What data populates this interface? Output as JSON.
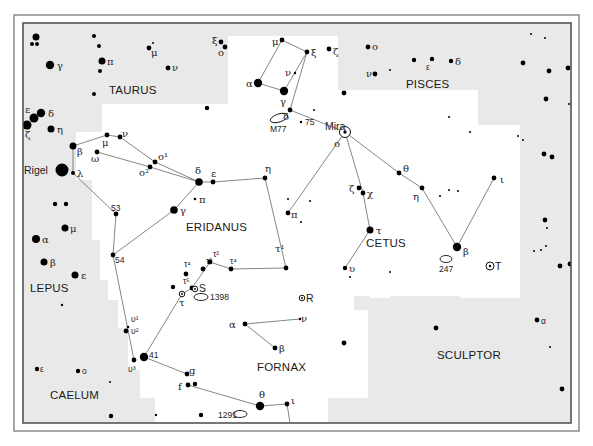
{
  "colors": {
    "outside": "#e9e9e9",
    "inside": "#ffffff",
    "frame_outer": "#8a8a8a",
    "frame_inner": "#4a4a4a",
    "line": "#777777",
    "star": "#000000"
  },
  "frame": {
    "outer": {
      "x": 14,
      "y": 15,
      "w": 565,
      "h": 416
    },
    "inner": {
      "x": 23,
      "y": 23,
      "w": 548,
      "h": 400
    }
  },
  "highlight_region": [
    [
      228,
      36
    ],
    [
      338,
      36
    ],
    [
      338,
      90
    ],
    [
      478,
      90
    ],
    [
      478,
      125
    ],
    [
      520,
      125
    ],
    [
      520,
      298
    ],
    [
      460,
      298
    ],
    [
      460,
      296
    ],
    [
      390,
      296
    ],
    [
      390,
      298
    ],
    [
      370,
      298
    ],
    [
      370,
      296
    ],
    [
      354,
      296
    ],
    [
      354,
      310
    ],
    [
      368,
      310
    ],
    [
      368,
      398
    ],
    [
      328,
      398
    ],
    [
      328,
      423
    ],
    [
      155,
      423
    ],
    [
      155,
      398
    ],
    [
      140,
      398
    ],
    [
      140,
      370
    ],
    [
      128,
      370
    ],
    [
      128,
      328
    ],
    [
      118,
      328
    ],
    [
      118,
      300
    ],
    [
      108,
      300
    ],
    [
      108,
      280
    ],
    [
      100,
      280
    ],
    [
      100,
      240
    ],
    [
      92,
      240
    ],
    [
      92,
      180
    ],
    [
      76,
      180
    ],
    [
      76,
      132
    ],
    [
      102,
      132
    ],
    [
      102,
      104
    ],
    [
      228,
      104
    ]
  ],
  "constellations": [
    {
      "name": "TAURUS",
      "x": 109,
      "y": 94
    },
    {
      "name": "PISCES",
      "x": 406,
      "y": 88
    },
    {
      "name": "ERIDANUS",
      "x": 186,
      "y": 231
    },
    {
      "name": "CETUS",
      "x": 366,
      "y": 247
    },
    {
      "name": "LEPUS",
      "x": 30,
      "y": 292
    },
    {
      "name": "FORNAX",
      "x": 257,
      "y": 371
    },
    {
      "name": "SCULPTOR",
      "x": 437,
      "y": 359
    },
    {
      "name": "CAELUM",
      "x": 50,
      "y": 399
    }
  ],
  "stars": [
    {
      "x": 36,
      "y": 37,
      "r": 3.5
    },
    {
      "x": 32,
      "y": 44,
      "r": 2
    },
    {
      "x": 37,
      "y": 44,
      "r": 2
    },
    {
      "x": 50,
      "y": 65,
      "r": 4.2,
      "label": "γ",
      "lx": 57,
      "ly": 69
    },
    {
      "x": 94,
      "y": 36,
      "r": 2
    },
    {
      "x": 99,
      "y": 46,
      "r": 2
    },
    {
      "x": 102,
      "y": 61,
      "r": 3.5,
      "label": "π",
      "lx": 107,
      "ly": 65
    },
    {
      "x": 100,
      "y": 71,
      "r": 2
    },
    {
      "x": 94,
      "y": 94,
      "r": 2
    },
    {
      "x": 149,
      "y": 48,
      "r": 2.4,
      "label": "μ",
      "lx": 151,
      "ly": 56
    },
    {
      "x": 153,
      "y": 43,
      "r": 1
    },
    {
      "x": 168,
      "y": 68,
      "r": 2.4,
      "label": "ν",
      "lx": 172,
      "ly": 71
    },
    {
      "x": 41,
      "y": 113,
      "r": 4.2,
      "label": "δ",
      "lx": 48,
      "ly": 117
    },
    {
      "x": 34,
      "y": 118,
      "r": 4.5,
      "label": "ε",
      "lx": 25,
      "ly": 113
    },
    {
      "x": 27,
      "y": 125,
      "r": 4.5,
      "label": "ζ",
      "lx": 25,
      "ly": 138
    },
    {
      "x": 51,
      "y": 129,
      "r": 3.5,
      "label": "η",
      "lx": 57,
      "ly": 133
    },
    {
      "x": 221,
      "y": 42,
      "r": 2.4,
      "label": "ξ",
      "lx": 212,
      "ly": 44
    },
    {
      "x": 225,
      "y": 47,
      "r": 2.4,
      "label": "o",
      "lx": 218,
      "ly": 56
    },
    {
      "x": 207,
      "y": 108,
      "r": 2.2
    },
    {
      "x": 282,
      "y": 40,
      "r": 2.4,
      "label": "μ",
      "lx": 272,
      "ly": 45
    },
    {
      "x": 307,
      "y": 52,
      "r": 2.4,
      "label": "ξ",
      "lx": 311,
      "ly": 56
    },
    {
      "x": 329,
      "y": 49,
      "r": 2.4,
      "label": "ζ",
      "lx": 333,
      "ly": 55
    },
    {
      "x": 295,
      "y": 73,
      "r": 1.2,
      "label": "ν",
      "lx": 285,
      "ly": 76
    },
    {
      "x": 258,
      "y": 83,
      "r": 4.2,
      "label": "α",
      "lx": 246,
      "ly": 87
    },
    {
      "x": 284,
      "y": 91,
      "r": 4.2,
      "label": "γ",
      "lx": 280,
      "ly": 105
    },
    {
      "x": 290,
      "y": 110,
      "r": 2.4,
      "label": "δ",
      "lx": 283,
      "ly": 120
    },
    {
      "x": 314,
      "y": 110,
      "r": 1
    },
    {
      "x": 301,
      "y": 122,
      "r": 1.2,
      "label": "75",
      "lx": 305,
      "ly": 125,
      "cls": "small"
    },
    {
      "x": 344,
      "y": 93,
      "r": 2.4
    },
    {
      "x": 368,
      "y": 47,
      "r": 2.4,
      "label": "o",
      "lx": 372,
      "ly": 50
    },
    {
      "x": 375,
      "y": 74,
      "r": 2.4,
      "label": "ν",
      "lx": 366,
      "ly": 77
    },
    {
      "x": 390,
      "y": 70,
      "r": 1
    },
    {
      "x": 414,
      "y": 60,
      "r": 2.2
    },
    {
      "x": 432,
      "y": 59,
      "r": 2.2,
      "label": "ε",
      "lx": 426,
      "ly": 70,
      "cls": "small"
    },
    {
      "x": 451,
      "y": 61,
      "r": 2.2,
      "label": "δ",
      "lx": 455,
      "ly": 65
    },
    {
      "x": 531,
      "y": 34,
      "r": 1
    },
    {
      "x": 545,
      "y": 38,
      "r": 1
    },
    {
      "x": 523,
      "y": 63,
      "r": 2.4
    },
    {
      "x": 549,
      "y": 71,
      "r": 2.4
    },
    {
      "x": 568,
      "y": 68,
      "r": 2.4
    },
    {
      "x": 546,
      "y": 99,
      "r": 2.4
    },
    {
      "x": 569,
      "y": 104,
      "r": 1
    },
    {
      "x": 449,
      "y": 117,
      "r": 1
    },
    {
      "x": 470,
      "y": 132,
      "r": 1
    },
    {
      "x": 518,
      "y": 136,
      "r": 1
    },
    {
      "x": 523,
      "y": 140,
      "r": 1
    },
    {
      "x": 544,
      "y": 154,
      "r": 2.4
    },
    {
      "x": 552,
      "y": 157,
      "r": 2.4
    },
    {
      "x": 73,
      "y": 146,
      "r": 3.5,
      "label": "β",
      "lx": 77,
      "ly": 155
    },
    {
      "x": 62,
      "y": 170,
      "r": 6.5,
      "label": "Rigel",
      "lx": 24,
      "ly": 174,
      "cls": "name"
    },
    {
      "x": 73,
      "y": 173,
      "r": 2,
      "label": "λ",
      "lx": 77,
      "ly": 177
    },
    {
      "x": 107,
      "y": 135,
      "r": 2.4,
      "label": "μ",
      "lx": 102,
      "ly": 146
    },
    {
      "x": 120,
      "y": 137,
      "r": 2.4,
      "label": "ν",
      "lx": 122,
      "ly": 137
    },
    {
      "x": 97,
      "y": 152,
      "r": 2.4,
      "label": "ω",
      "lx": 91,
      "ly": 162
    },
    {
      "x": 155,
      "y": 162,
      "r": 2.4,
      "label": "o¹",
      "lx": 158,
      "ly": 160
    },
    {
      "x": 150,
      "y": 167,
      "r": 2.4,
      "label": "o²",
      "lx": 139,
      "ly": 176
    },
    {
      "x": 199,
      "y": 182,
      "r": 3.8,
      "label": "δ",
      "lx": 195,
      "ly": 174
    },
    {
      "x": 213,
      "y": 182,
      "r": 2.4,
      "label": "ε",
      "lx": 211,
      "ly": 177
    },
    {
      "x": 195,
      "y": 199,
      "r": 1.3,
      "label": "π",
      "lx": 199,
      "ly": 203
    },
    {
      "x": 174,
      "y": 210,
      "r": 3.8,
      "label": "γ",
      "lx": 180,
      "ly": 214
    },
    {
      "x": 265,
      "y": 178,
      "r": 2.4,
      "label": "η",
      "lx": 265,
      "ly": 172
    },
    {
      "x": 55,
      "y": 204,
      "r": 2.2
    },
    {
      "x": 66,
      "y": 204,
      "r": 2.2
    },
    {
      "x": 116,
      "y": 214,
      "r": 2.4,
      "label": "53",
      "lx": 111,
      "ly": 211,
      "cls": "small"
    },
    {
      "x": 65,
      "y": 228,
      "r": 3.5,
      "label": "μ",
      "lx": 70,
      "ly": 232
    },
    {
      "x": 36,
      "y": 239,
      "r": 4,
      "label": "α",
      "lx": 42,
      "ly": 243
    },
    {
      "x": 44,
      "y": 262,
      "r": 3.5,
      "label": "β",
      "lx": 50,
      "ly": 266
    },
    {
      "x": 75,
      "y": 275,
      "r": 3.5,
      "label": "ε",
      "lx": 81,
      "ly": 279
    },
    {
      "x": 113,
      "y": 255,
      "r": 2.4,
      "label": "54",
      "lx": 115,
      "ly": 263,
      "cls": "small"
    },
    {
      "x": 62,
      "y": 305,
      "r": 1.2
    },
    {
      "x": 288,
      "y": 213,
      "r": 2.4,
      "label": "π",
      "lx": 291,
      "ly": 218
    },
    {
      "x": 288,
      "y": 199,
      "r": 1
    },
    {
      "x": 310,
      "y": 201,
      "r": 1
    },
    {
      "x": 301,
      "y": 222,
      "r": 1
    },
    {
      "x": 286,
      "y": 268,
      "r": 2.4,
      "label": "τ¹",
      "lx": 275,
      "ly": 252
    },
    {
      "x": 345,
      "y": 132,
      "r": 0,
      "marker": "circle-dot",
      "label": "Mira",
      "lx": 325,
      "ly": 130,
      "cls": "name"
    },
    {
      "x": 338,
      "y": 146,
      "r": 0,
      "label": "o",
      "lx": 334,
      "ly": 147
    },
    {
      "x": 399,
      "y": 173,
      "r": 2.4,
      "label": "θ",
      "lx": 403,
      "ly": 172
    },
    {
      "x": 422,
      "y": 188,
      "r": 2.4,
      "label": "η",
      "lx": 413,
      "ly": 200
    },
    {
      "x": 449,
      "y": 190,
      "r": 1
    },
    {
      "x": 440,
      "y": 196,
      "r": 1
    },
    {
      "x": 458,
      "y": 191,
      "r": 1
    },
    {
      "x": 494,
      "y": 178,
      "r": 2.4,
      "label": "ι",
      "lx": 500,
      "ly": 183
    },
    {
      "x": 359,
      "y": 188,
      "r": 2.4,
      "label": "ζ",
      "lx": 349,
      "ly": 192
    },
    {
      "x": 363,
      "y": 193,
      "r": 2.4,
      "label": "χ",
      "lx": 367,
      "ly": 197
    },
    {
      "x": 370,
      "y": 230,
      "r": 3.5,
      "label": "τ",
      "lx": 376,
      "ly": 234
    },
    {
      "x": 457,
      "y": 247,
      "r": 4.2,
      "label": "β",
      "lx": 463,
      "ly": 255
    },
    {
      "x": 345,
      "y": 268,
      "r": 2.2,
      "label": "υ",
      "lx": 349,
      "ly": 272
    },
    {
      "x": 350,
      "y": 277,
      "r": 1
    },
    {
      "x": 390,
      "y": 272,
      "r": 1
    },
    {
      "x": 545,
      "y": 220,
      "r": 2.4
    },
    {
      "x": 547,
      "y": 228,
      "r": 1
    },
    {
      "x": 534,
      "y": 251,
      "r": 1
    },
    {
      "x": 541,
      "y": 250,
      "r": 1
    },
    {
      "x": 546,
      "y": 246,
      "r": 1
    },
    {
      "x": 560,
      "y": 266,
      "r": 2.4
    },
    {
      "x": 570,
      "y": 264,
      "r": 2.4
    },
    {
      "x": 490,
      "y": 266,
      "r": 0,
      "marker": "circle-dot",
      "mr": 4,
      "label": "T",
      "lx": 495,
      "ly": 270,
      "cls": "name"
    },
    {
      "x": 186,
      "y": 274,
      "r": 2.4,
      "label": "τ⁴",
      "lx": 184,
      "ly": 267,
      "cls": "small"
    },
    {
      "x": 203,
      "y": 269,
      "r": 2.4,
      "label": "τ³",
      "lx": 206,
      "ly": 264,
      "cls": "small"
    },
    {
      "x": 210,
      "y": 262,
      "r": 2.4,
      "label": "τ²",
      "lx": 213,
      "ly": 257,
      "cls": "small"
    },
    {
      "x": 231,
      "y": 269,
      "r": 2.4,
      "label": "τ⁴",
      "lx": 230,
      "ly": 264,
      "cls": "small"
    },
    {
      "x": 192,
      "y": 288,
      "r": 2.4,
      "label": "τ⁵",
      "lx": 183,
      "ly": 284,
      "cls": "small"
    },
    {
      "x": 173,
      "y": 287,
      "r": 2.2
    },
    {
      "x": 182,
      "y": 294,
      "r": 0,
      "marker": "circle-dot",
      "mr": 2.8,
      "label": "τ",
      "lx": 179,
      "ly": 306
    },
    {
      "x": 195,
      "y": 289,
      "r": 0,
      "marker": "circle-dot",
      "mr": 2.8,
      "label": "S",
      "lx": 199,
      "ly": 292,
      "cls": "name"
    },
    {
      "x": 302,
      "y": 298,
      "r": 0,
      "marker": "circle-dot",
      "mr": 2.8,
      "label": "R",
      "lx": 306,
      "ly": 302,
      "cls": "name"
    },
    {
      "x": 128,
      "y": 327,
      "r": 1.3,
      "label": "υ¹",
      "lx": 131,
      "ly": 322,
      "cls": "small"
    },
    {
      "x": 126,
      "y": 331,
      "r": 2.4,
      "label": "υ²",
      "lx": 131,
      "ly": 334,
      "cls": "small"
    },
    {
      "x": 134,
      "y": 360,
      "r": 2.4,
      "label": "υ³",
      "lx": 128,
      "ly": 372,
      "cls": "small"
    },
    {
      "x": 144,
      "y": 357,
      "r": 4.2,
      "label": "41",
      "lx": 149,
      "ly": 358,
      "cls": "small"
    },
    {
      "x": 245,
      "y": 324,
      "r": 2.4,
      "label": "α",
      "lx": 229,
      "ly": 328
    },
    {
      "x": 300,
      "y": 319,
      "r": 1.3,
      "label": "ν",
      "lx": 301,
      "ly": 322
    },
    {
      "x": 275,
      "y": 348,
      "r": 2.4,
      "label": "β",
      "lx": 279,
      "ly": 352
    },
    {
      "x": 344,
      "y": 343,
      "r": 2.4
    },
    {
      "x": 436,
      "y": 328,
      "r": 2.4
    },
    {
      "x": 537,
      "y": 320,
      "r": 2.4,
      "label": "α",
      "lx": 541,
      "ly": 324,
      "cls": "small"
    },
    {
      "x": 550,
      "y": 347,
      "r": 1
    },
    {
      "x": 562,
      "y": 389,
      "r": 2.4
    },
    {
      "x": 4,
      "y": 368,
      "r": 2.4
    },
    {
      "x": 37,
      "y": 369,
      "r": 2.2,
      "label": "ε",
      "lx": 40,
      "ly": 372,
      "cls": "small"
    },
    {
      "x": 78,
      "y": 371,
      "r": 2.2,
      "label": "o",
      "lx": 82,
      "ly": 374,
      "cls": "small"
    },
    {
      "x": 110,
      "y": 382,
      "r": 1
    },
    {
      "x": 187,
      "y": 374,
      "r": 2.4,
      "label": "g",
      "lx": 189,
      "ly": 374
    },
    {
      "x": 188,
      "y": 385,
      "r": 2.4,
      "label": "f",
      "lx": 178,
      "ly": 390
    },
    {
      "x": 195,
      "y": 384,
      "r": 2.2
    },
    {
      "x": 260,
      "y": 406,
      "r": 4.2,
      "label": "θ",
      "lx": 259,
      "ly": 398
    },
    {
      "x": 287,
      "y": 404,
      "r": 2.4,
      "label": "ι",
      "lx": 291,
      "ly": 404
    },
    {
      "x": 111,
      "y": 416,
      "r": 2.2
    },
    {
      "x": 156,
      "y": 415,
      "r": 1.2
    },
    {
      "x": 201,
      "y": 415,
      "r": 2.2
    }
  ],
  "deep_sky": [
    {
      "label": "M77",
      "ex": 279,
      "ey": 118,
      "rx": 9,
      "ry": 4,
      "rot": -18,
      "lx": 270,
      "ly": 132
    },
    {
      "label": "1398",
      "ex": 201,
      "ey": 297,
      "rx": 7,
      "ry": 3.5,
      "rot": 0,
      "lx": 210,
      "ly": 300
    },
    {
      "label": "247",
      "ex": 446,
      "ey": 259,
      "rx": 6,
      "ry": 3.5,
      "rot": 0,
      "lx": 439,
      "ly": 272
    },
    {
      "label": "1291",
      "ex": 240,
      "ey": 414,
      "rx": 7,
      "ry": 3.5,
      "rot": 0,
      "lx": 218,
      "ly": 418
    }
  ],
  "lines": [
    [
      [
        282,
        40
      ],
      [
        307,
        52
      ]
    ],
    [
      [
        282,
        40
      ],
      [
        258,
        83
      ]
    ],
    [
      [
        258,
        83
      ],
      [
        284,
        91
      ]
    ],
    [
      [
        284,
        91
      ],
      [
        307,
        52
      ]
    ],
    [
      [
        307,
        52
      ],
      [
        290,
        110
      ]
    ],
    [
      [
        290,
        110
      ],
      [
        345,
        132
      ]
    ],
    [
      [
        345,
        132
      ],
      [
        399,
        173
      ]
    ],
    [
      [
        399,
        173
      ],
      [
        422,
        188
      ]
    ],
    [
      [
        422,
        188
      ],
      [
        457,
        247
      ]
    ],
    [
      [
        457,
        247
      ],
      [
        494,
        178
      ]
    ],
    [
      [
        345,
        132
      ],
      [
        363,
        193
      ]
    ],
    [
      [
        363,
        193
      ],
      [
        370,
        230
      ]
    ],
    [
      [
        370,
        230
      ],
      [
        345,
        268
      ]
    ],
    [
      [
        345,
        132
      ],
      [
        288,
        213
      ]
    ],
    [
      [
        73,
        146
      ],
      [
        107,
        135
      ]
    ],
    [
      [
        107,
        135
      ],
      [
        120,
        137
      ]
    ],
    [
      [
        120,
        137
      ],
      [
        155,
        162
      ]
    ],
    [
      [
        155,
        162
      ],
      [
        199,
        182
      ]
    ],
    [
      [
        97,
        152
      ],
      [
        150,
        167
      ]
    ],
    [
      [
        150,
        167
      ],
      [
        199,
        182
      ]
    ],
    [
      [
        73,
        146
      ],
      [
        73,
        173
      ]
    ],
    [
      [
        73,
        173
      ],
      [
        116,
        214
      ]
    ],
    [
      [
        199,
        182
      ],
      [
        213,
        182
      ]
    ],
    [
      [
        213,
        182
      ],
      [
        265,
        178
      ]
    ],
    [
      [
        265,
        178
      ],
      [
        286,
        268
      ]
    ],
    [
      [
        199,
        182
      ],
      [
        174,
        210
      ]
    ],
    [
      [
        174,
        210
      ],
      [
        113,
        255
      ]
    ],
    [
      [
        116,
        214
      ],
      [
        113,
        255
      ]
    ],
    [
      [
        113,
        255
      ],
      [
        134,
        360
      ]
    ],
    [
      [
        286,
        268
      ],
      [
        231,
        269
      ]
    ],
    [
      [
        231,
        269
      ],
      [
        210,
        262
      ]
    ],
    [
      [
        210,
        262
      ],
      [
        192,
        288
      ]
    ],
    [
      [
        192,
        288
      ],
      [
        182,
        294
      ]
    ],
    [
      [
        182,
        294
      ],
      [
        144,
        357
      ]
    ],
    [
      [
        144,
        357
      ],
      [
        187,
        374
      ]
    ],
    [
      [
        188,
        385
      ],
      [
        260,
        406
      ]
    ],
    [
      [
        260,
        406
      ],
      [
        287,
        404
      ]
    ],
    [
      [
        287,
        404
      ],
      [
        290,
        423
      ]
    ],
    [
      [
        245,
        324
      ],
      [
        300,
        319
      ]
    ],
    [
      [
        245,
        324
      ],
      [
        275,
        348
      ]
    ]
  ]
}
